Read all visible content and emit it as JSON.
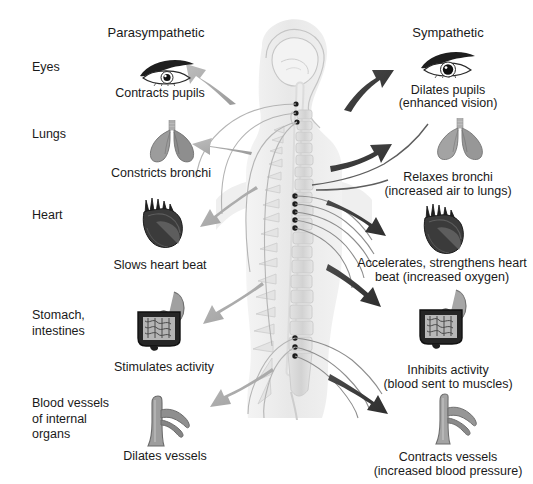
{
  "diagram": {
    "columns": {
      "left_header": "Parasympathetic",
      "right_header": "Sympathetic"
    },
    "colors": {
      "parasympathetic_arrow": "#a8a8a8",
      "sympathetic_arrow": "#3c3c3c",
      "body_silhouette": "#ececec",
      "spine_outline": "#c9c9c9",
      "nerve_line": "#9a9a9a",
      "ganglion_dot": "#1c1c1c",
      "background": "#ffffff",
      "text": "#1a1a1a"
    },
    "organ_rows": [
      {
        "row_label": "Eyes",
        "icon": "eye-icon",
        "parasympathetic_effect": "Contracts pupils",
        "sympathetic_effect": "Dilates pupils",
        "sympathetic_effect_note": "(enhanced vision)"
      },
      {
        "row_label": "Lungs",
        "icon": "lungs-icon",
        "parasympathetic_effect": "Constricts bronchi",
        "sympathetic_effect": "Relaxes bronchi",
        "sympathetic_effect_note": "(increased air to lungs)"
      },
      {
        "row_label": "Heart",
        "icon": "heart-icon",
        "parasympathetic_effect": "Slows heart beat",
        "sympathetic_effect": "Accelerates, strengthens heart",
        "sympathetic_effect_note": "beat (increased oxygen)"
      },
      {
        "row_label": "Stomach,\nintestines",
        "icon": "stomach-intestines-icon",
        "parasympathetic_effect": "Stimulates activity",
        "sympathetic_effect": "Inhibits activity",
        "sympathetic_effect_note": "(blood sent to muscles)"
      },
      {
        "row_label": "Blood vessels\nof internal\norgans",
        "icon": "blood-vessel-icon",
        "parasympathetic_effect": "Dilates vessels",
        "sympathetic_effect": "Contracts vessels",
        "sympathetic_effect_note": "(increased blood pressure)"
      }
    ],
    "central_figure": {
      "name": "human-head-and-spine-figure",
      "parts": [
        "brain",
        "skull-profile",
        "spinal-cord",
        "vertebral-column",
        "sacrum",
        "ganglion-chain",
        "nerve-fibers"
      ]
    }
  }
}
